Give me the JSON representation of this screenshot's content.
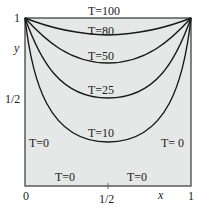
{
  "figure": {
    "colors": {
      "background": "#e6e8e8",
      "curve": "#1a1a1a",
      "text": "#222222"
    },
    "boundary_labels": {
      "top": "T=100",
      "left": "T=0",
      "right": "T= 0",
      "bottom_left": "T=0",
      "bottom_right": "T=0"
    },
    "isotherms": [
      {
        "label": "T=80",
        "value": 80
      },
      {
        "label": "T=50",
        "value": 50
      },
      {
        "label": "T=25",
        "value": 25
      },
      {
        "label": "T=10",
        "value": 10
      }
    ],
    "axes": {
      "x_label": "x",
      "y_label": "y",
      "x_ticks": [
        "0",
        "1/2",
        "1"
      ],
      "y_ticks": [
        "1/2",
        "1"
      ]
    }
  }
}
